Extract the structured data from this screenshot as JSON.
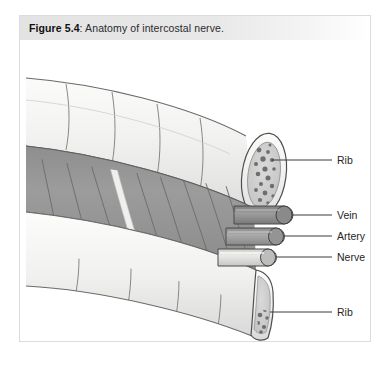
{
  "figure": {
    "caption_label": "Figure 5.4",
    "caption_separator": ":",
    "caption_text": "Anatomy of intercostal nerve.",
    "caption_full": "Figure 5.4: Anatomy of intercostal nerve."
  },
  "labels": [
    {
      "id": "rib-upper",
      "text": "Rib"
    },
    {
      "id": "vein",
      "text": "Vein"
    },
    {
      "id": "artery",
      "text": "Artery"
    },
    {
      "id": "nerve",
      "text": "Nerve"
    },
    {
      "id": "rib-lower",
      "text": "Rib"
    }
  ],
  "structures": {
    "rib_upper": "upper rib cylinder with cut cross-section",
    "rib_lower": "lower rib cylinder with cut cross-section",
    "intercostal_muscle": "intercostal muscle with diagonal fiber striations",
    "neurovascular_strip": "pale vertical neurovascular band over muscle",
    "bundle": [
      "vein tube",
      "artery tube",
      "nerve tube"
    ],
    "marrow": "cancellous bone speckle in rib cross-section"
  },
  "colors": {
    "page_background": "#ffffff",
    "figure_border": "#dcdcdc",
    "caption_gradient_start": "#e3e3e3",
    "caption_gradient_end": "#ffffff",
    "caption_label_color": "#111111",
    "caption_text_color": "#2b2b2b",
    "bone_fill": "#f2f2f0",
    "bone_shade": "#e4e4e2",
    "bone_outline": "#5b5b5b",
    "marrow_fill": "#cfcfcf",
    "marrow_speckle": "#6a6a6a",
    "muscle_fill": "#9a9a9a",
    "muscle_fiber": "#6f6f6f",
    "muscle_shadow": "#8a8a8a",
    "strip_fill": "#efefed",
    "vein_fill": "#8f8f8f",
    "artery_fill": "#a0a0a0",
    "nerve_fill": "#dcdcda",
    "tube_outline": "#4a4a4a",
    "leader_line": "#3a3a3a",
    "label_text": "#262626"
  }
}
